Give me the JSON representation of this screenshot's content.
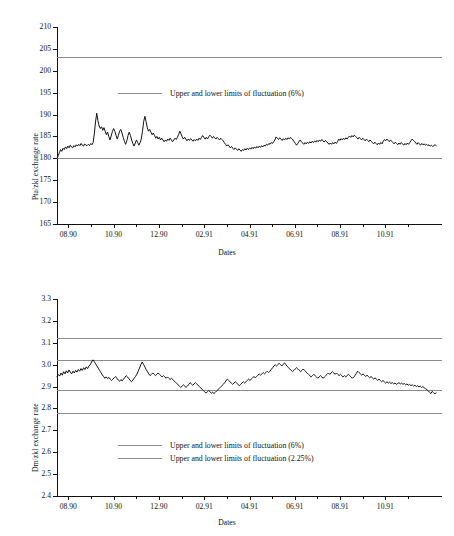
{
  "chart_data": [
    {
      "type": "line",
      "panel": "top",
      "title": "",
      "xlabel": "Dates",
      "ylabel": "Pta/zkl exchange rate",
      "ylim": [
        165,
        210
      ],
      "yticks": [
        165,
        170,
        175,
        180,
        185,
        190,
        195,
        200,
        205,
        210
      ],
      "ytick_labels": [
        "165",
        "170",
        "175",
        "180",
        "185",
        "190",
        "195",
        "200",
        "205",
        "210"
      ],
      "xlim": [
        0,
        17
      ],
      "xtick_labels": [
        "08.90",
        "10.90",
        "12.90",
        "02.91",
        "04.91",
        "06.91",
        "08.91",
        "10.91"
      ],
      "xtick_positions": [
        0.5,
        2.5,
        4.5,
        6.5,
        8.5,
        10.5,
        12.5,
        14.5
      ],
      "grid": false,
      "legend_position": "inside-upper-center",
      "legend": [
        {
          "label": "Upper and lower limits of fluctuation (6%)",
          "color": "#8a8a8a"
        }
      ],
      "reference_lines": [
        {
          "value": 203.2,
          "label": "Upper limit of fluctuation (6%)",
          "color": "#8a8a8a"
        },
        {
          "value": 180.0,
          "label": "Lower limit of fluctuation (6%)",
          "color": "#8a8a8a"
        }
      ],
      "series": [
        {
          "name": "Pta/zkl exchange rate",
          "color": "#111111",
          "values": [
            180.0,
            180.6,
            181.3,
            182.0,
            181.6,
            182.3,
            182.0,
            182.6,
            182.2,
            182.8,
            182.4,
            183.0,
            182.6,
            182.4,
            182.9,
            182.6,
            183.1,
            182.8,
            183.2,
            182.9,
            183.4,
            183.0,
            182.8,
            183.3,
            183.0,
            182.9,
            183.2,
            182.9,
            183.4,
            183.1,
            183.6,
            185.6,
            188.3,
            190.3,
            188.6,
            187.4,
            186.8,
            187.2,
            186.4,
            187.0,
            186.2,
            185.4,
            186.0,
            185.0,
            184.2,
            185.1,
            186.1,
            186.8,
            186.2,
            185.3,
            184.4,
            185.2,
            186.2,
            186.6,
            185.8,
            184.8,
            183.9,
            183.2,
            184.0,
            185.2,
            186.0,
            185.2,
            184.2,
            183.4,
            182.8,
            183.5,
            184.2,
            183.6,
            183.0,
            183.6,
            184.4,
            186.2,
            188.4,
            189.6,
            188.4,
            187.0,
            186.2,
            186.6,
            186.0,
            185.4,
            185.8,
            185.2,
            184.6,
            185.0,
            184.4,
            184.8,
            184.2,
            184.6,
            184.2,
            183.8,
            184.2,
            183.9,
            184.4,
            184.1,
            184.6,
            184.2,
            183.8,
            184.2,
            184.6,
            184.3,
            184.8,
            185.4,
            186.2,
            185.6,
            184.9,
            184.4,
            184.8,
            184.4,
            184.0,
            184.4,
            184.1,
            184.5,
            184.2,
            183.9,
            184.3,
            184.0,
            184.4,
            184.1,
            184.6,
            184.3,
            184.8,
            185.2,
            184.8,
            184.4,
            184.8,
            184.4,
            184.9,
            185.3,
            185.0,
            184.6,
            185.0,
            184.7,
            184.4,
            184.8,
            184.5,
            184.2,
            184.6,
            184.3,
            184.0,
            183.6,
            183.2,
            182.8,
            183.1,
            182.8,
            182.4,
            182.7,
            182.3,
            182.0,
            182.4,
            182.1,
            181.8,
            182.2,
            181.9,
            181.6,
            182.0,
            181.8,
            182.2,
            181.9,
            182.3,
            182.0,
            182.4,
            182.1,
            182.5,
            182.2,
            182.6,
            182.3,
            182.7,
            182.4,
            182.8,
            182.5,
            182.9,
            182.6,
            183.0,
            182.8,
            183.2,
            183.0,
            183.4,
            183.2,
            183.6,
            183.4,
            183.8,
            184.2,
            184.9,
            184.6,
            184.3,
            184.7,
            184.4,
            184.1,
            184.5,
            184.2,
            184.6,
            184.3,
            184.7,
            184.4,
            184.8,
            184.5,
            184.2,
            183.8,
            183.4,
            183.0,
            183.4,
            183.8,
            184.2,
            183.8,
            183.5,
            183.2,
            183.6,
            183.3,
            183.7,
            183.4,
            183.8,
            183.5,
            183.9,
            183.6,
            184.0,
            183.7,
            184.1,
            183.8,
            184.2,
            183.9,
            184.3,
            184.0,
            183.7,
            184.1,
            183.8,
            183.5,
            183.2,
            183.5,
            183.2,
            183.6,
            183.3,
            183.7,
            183.4,
            183.8,
            184.4,
            184.1,
            184.5,
            184.2,
            184.6,
            184.3,
            184.7,
            184.4,
            184.8,
            185.1,
            184.8,
            185.2,
            184.9,
            185.3,
            185.0,
            184.7,
            184.4,
            184.8,
            184.5,
            184.2,
            184.6,
            184.3,
            184.0,
            184.4,
            184.1,
            183.8,
            184.2,
            183.9,
            183.6,
            183.3,
            183.7,
            183.4,
            183.1,
            183.5,
            183.2,
            183.6,
            183.3,
            183.9,
            184.3,
            184.0,
            184.4,
            184.1,
            183.8,
            184.2,
            183.9,
            183.6,
            183.3,
            183.7,
            183.4,
            183.1,
            183.5,
            183.2,
            183.6,
            183.3,
            183.0,
            183.4,
            183.1,
            183.5,
            183.2,
            183.6,
            184.0,
            184.4,
            184.1,
            183.8,
            183.5,
            183.2,
            183.6,
            183.3,
            183.0,
            183.4,
            183.1,
            183.3,
            183.0,
            183.2,
            182.9,
            183.1,
            182.8,
            183.0,
            182.7,
            182.9,
            183.1,
            182.9
          ]
        }
      ]
    },
    {
      "type": "line",
      "panel": "bottom",
      "title": "",
      "xlabel": "Dates",
      "ylabel": "Dm/zkl exchange rate",
      "ylim": [
        2.4,
        3.3
      ],
      "yticks": [
        2.4,
        2.5,
        2.6,
        2.7,
        2.8,
        2.9,
        3.0,
        3.1,
        3.2,
        3.3
      ],
      "ytick_labels": [
        "2.4",
        "2.5",
        "2.6",
        "2.7",
        "2.8",
        "2.9",
        "3.0",
        "3.1",
        "3.2",
        "3.3"
      ],
      "xlim": [
        0,
        17
      ],
      "xtick_labels": [
        "08.90",
        "10.90",
        "12.90",
        "02.91",
        "04.91",
        "06.91",
        "08.91",
        "10.91"
      ],
      "xtick_positions": [
        0.5,
        2.5,
        4.5,
        6.5,
        8.5,
        10.5,
        12.5,
        14.5
      ],
      "grid": false,
      "legend_position": "inside-lower-center",
      "legend": [
        {
          "label": "Upper and lower limits of fluctuation (6%)",
          "color": "#8a8a8a"
        },
        {
          "label": "Upper and lower limits of fluctuation (2.25%)",
          "color": "#8a8a8a"
        }
      ],
      "reference_lines": [
        {
          "value": 3.12,
          "label": "Upper limit of fluctuation (6%)",
          "color": "#8a8a8a"
        },
        {
          "value": 3.02,
          "label": "Upper limit of fluctuation (2.25%)",
          "color": "#8a8a8a"
        },
        {
          "value": 2.885,
          "label": "Lower limit of fluctuation (2.25%)",
          "color": "#8a8a8a"
        },
        {
          "value": 2.78,
          "label": "Lower limit of fluctuation (6%)",
          "color": "#8a8a8a"
        }
      ],
      "series": [
        {
          "name": "Dm/zkl exchange rate",
          "color": "#111111",
          "values": [
            2.945,
            2.955,
            2.948,
            2.962,
            2.952,
            2.968,
            2.958,
            2.972,
            2.962,
            2.976,
            2.966,
            2.958,
            2.97,
            2.962,
            2.974,
            2.966,
            2.978,
            2.97,
            2.982,
            2.974,
            2.986,
            2.978,
            2.99,
            2.982,
            2.994,
            3.0,
            3.012,
            3.022,
            3.014,
            3.004,
            2.994,
            2.984,
            2.974,
            2.964,
            2.954,
            2.946,
            2.938,
            2.944,
            2.936,
            2.942,
            2.934,
            2.928,
            2.934,
            2.94,
            2.946,
            2.938,
            2.93,
            2.924,
            2.932,
            2.926,
            2.934,
            2.942,
            2.95,
            2.944,
            2.936,
            2.928,
            2.922,
            2.93,
            2.938,
            2.946,
            2.956,
            2.97,
            2.984,
            3.0,
            3.012,
            3.002,
            2.99,
            2.978,
            2.968,
            2.958,
            2.95,
            2.956,
            2.962,
            2.956,
            2.95,
            2.956,
            2.962,
            2.956,
            2.95,
            2.944,
            2.95,
            2.944,
            2.938,
            2.944,
            2.938,
            2.932,
            2.938,
            2.932,
            2.926,
            2.92,
            2.914,
            2.908,
            2.902,
            2.896,
            2.902,
            2.908,
            2.902,
            2.896,
            2.902,
            2.91,
            2.918,
            2.912,
            2.906,
            2.912,
            2.918,
            2.912,
            2.906,
            2.9,
            2.894,
            2.888,
            2.882,
            2.876,
            2.87,
            2.876,
            2.882,
            2.876,
            2.87,
            2.874,
            2.868,
            2.874,
            2.88,
            2.886,
            2.892,
            2.898,
            2.904,
            2.91,
            2.918,
            2.926,
            2.934,
            2.928,
            2.922,
            2.916,
            2.91,
            2.916,
            2.922,
            2.916,
            2.91,
            2.904,
            2.91,
            2.916,
            2.922,
            2.916,
            2.922,
            2.928,
            2.934,
            2.928,
            2.934,
            2.94,
            2.946,
            2.94,
            2.946,
            2.952,
            2.958,
            2.952,
            2.958,
            2.964,
            2.958,
            2.964,
            2.97,
            2.964,
            2.97,
            2.978,
            2.986,
            2.994,
            3.0,
            2.994,
            3.0,
            3.006,
            3.0,
            2.994,
            3.002,
            3.008,
            3.0,
            2.992,
            2.986,
            2.98,
            2.974,
            2.968,
            2.974,
            2.98,
            2.986,
            2.98,
            2.974,
            2.968,
            2.974,
            2.98,
            2.974,
            2.968,
            2.962,
            2.956,
            2.95,
            2.944,
            2.95,
            2.956,
            2.95,
            2.944,
            2.938,
            2.944,
            2.95,
            2.944,
            2.938,
            2.944,
            2.95,
            2.956,
            2.962,
            2.956,
            2.962,
            2.968,
            2.962,
            2.956,
            2.962,
            2.956,
            2.95,
            2.956,
            2.95,
            2.944,
            2.95,
            2.944,
            2.95,
            2.956,
            2.95,
            2.944,
            2.938,
            2.944,
            2.95,
            2.96,
            2.97,
            2.964,
            2.958,
            2.952,
            2.958,
            2.952,
            2.946,
            2.952,
            2.946,
            2.94,
            2.946,
            2.94,
            2.934,
            2.94,
            2.934,
            2.928,
            2.934,
            2.928,
            2.922,
            2.928,
            2.922,
            2.916,
            2.922,
            2.916,
            2.92,
            2.914,
            2.918,
            2.912,
            2.916,
            2.91,
            2.914,
            2.918,
            2.912,
            2.916,
            2.91,
            2.914,
            2.908,
            2.912,
            2.906,
            2.91,
            2.904,
            2.908,
            2.902,
            2.906,
            2.9,
            2.904,
            2.898,
            2.902,
            2.896,
            2.9,
            2.894,
            2.89,
            2.886,
            2.88,
            2.874,
            2.868,
            2.878,
            2.872,
            2.866,
            2.872
          ]
        }
      ]
    }
  ]
}
